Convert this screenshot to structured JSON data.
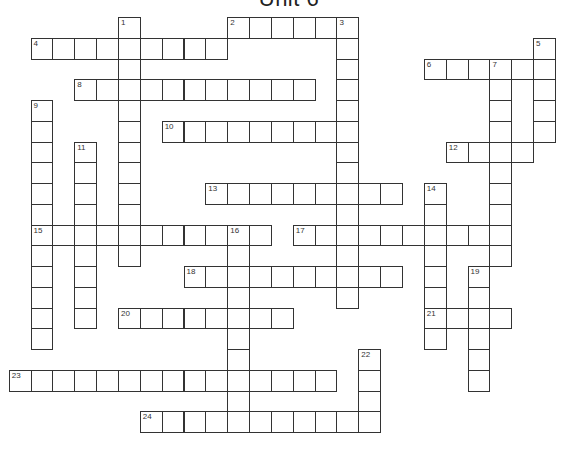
{
  "title": "Unit 6",
  "grid": {
    "origin_x": 8.7,
    "origin_y": 17,
    "cell_w": 21.85,
    "cell_h": 20.75,
    "line_color": "#333333"
  },
  "entries": [
    {
      "number": "1",
      "direction": "down",
      "col": 5,
      "row": 0,
      "length": 12
    },
    {
      "number": "2",
      "direction": "across",
      "col": 10,
      "row": 0,
      "length": 6
    },
    {
      "number": "3",
      "direction": "down",
      "col": 15,
      "row": 0,
      "length": 14
    },
    {
      "number": "4",
      "direction": "across",
      "col": 1,
      "row": 1,
      "length": 9
    },
    {
      "number": "5",
      "direction": "down",
      "col": 24,
      "row": 1,
      "length": 5
    },
    {
      "number": "6",
      "direction": "across",
      "col": 19,
      "row": 2,
      "length": 6
    },
    {
      "number": "7",
      "direction": "down",
      "col": 22,
      "row": 2,
      "length": 10
    },
    {
      "number": "8",
      "direction": "across",
      "col": 3,
      "row": 3,
      "length": 11
    },
    {
      "number": "9",
      "direction": "down",
      "col": 1,
      "row": 4,
      "length": 12
    },
    {
      "number": "10",
      "direction": "across",
      "col": 7,
      "row": 5,
      "length": 9
    },
    {
      "number": "11",
      "direction": "down",
      "col": 3,
      "row": 6,
      "length": 9
    },
    {
      "number": "12",
      "direction": "across",
      "col": 20,
      "row": 6,
      "length": 4
    },
    {
      "number": "13",
      "direction": "across",
      "col": 9,
      "row": 8,
      "length": 9
    },
    {
      "number": "14",
      "direction": "down",
      "col": 19,
      "row": 8,
      "length": 8
    },
    {
      "number": "15",
      "direction": "across",
      "col": 1,
      "row": 10,
      "length": 11
    },
    {
      "number": "16",
      "direction": "down",
      "col": 10,
      "row": 10,
      "length": 10
    },
    {
      "number": "17",
      "direction": "across",
      "col": 13,
      "row": 10,
      "length": 10
    },
    {
      "number": "18",
      "direction": "across",
      "col": 8,
      "row": 12,
      "length": 10
    },
    {
      "number": "19",
      "direction": "down",
      "col": 21,
      "row": 12,
      "length": 6
    },
    {
      "number": "20",
      "direction": "across",
      "col": 5,
      "row": 14,
      "length": 8
    },
    {
      "number": "21",
      "direction": "across",
      "col": 19,
      "row": 14,
      "length": 4
    },
    {
      "number": "22",
      "direction": "down",
      "col": 16,
      "row": 16,
      "length": 4
    },
    {
      "number": "23",
      "direction": "across",
      "col": 0,
      "row": 17,
      "length": 15
    },
    {
      "number": "24",
      "direction": "across",
      "col": 6,
      "row": 19,
      "length": 11
    }
  ]
}
